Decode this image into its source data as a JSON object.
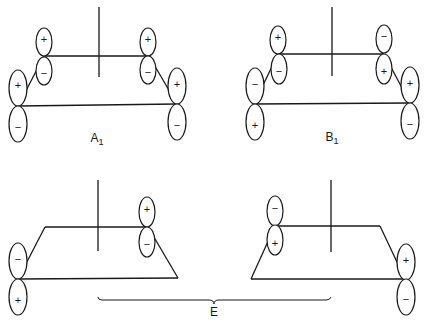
{
  "diagram": {
    "type": "molecular-orbital-symmetry",
    "panels": [
      {
        "id": "A1",
        "label": "A",
        "subscript": "1",
        "top_left_orbital": {
          "upper": "+",
          "lower": "−"
        },
        "top_right_orbital": {
          "upper": "+",
          "lower": "−"
        },
        "bottom_left_orbital": {
          "upper": "+",
          "lower": "−"
        },
        "bottom_right_orbital": {
          "upper": "+",
          "lower": "−"
        }
      },
      {
        "id": "B1",
        "label": "B",
        "subscript": "1",
        "top_left_orbital": {
          "upper": "+",
          "lower": "−"
        },
        "top_right_orbital": {
          "upper": "−",
          "lower": "+"
        },
        "bottom_left_orbital": {
          "upper": "−",
          "lower": "+"
        },
        "bottom_right_orbital": {
          "upper": "+",
          "lower": "−"
        }
      },
      {
        "id": "E-left",
        "top_right_orbital": {
          "upper": "+",
          "lower": "−"
        },
        "bottom_left_orbital": {
          "upper": "−",
          "lower": "+"
        }
      },
      {
        "id": "E-right",
        "top_left_orbital": {
          "upper": "−",
          "lower": "+"
        },
        "bottom_right_orbital": {
          "upper": "+",
          "lower": "−"
        }
      }
    ],
    "brace_label": "E",
    "line_color": "#1a1a1a",
    "background": "#ffffff"
  }
}
